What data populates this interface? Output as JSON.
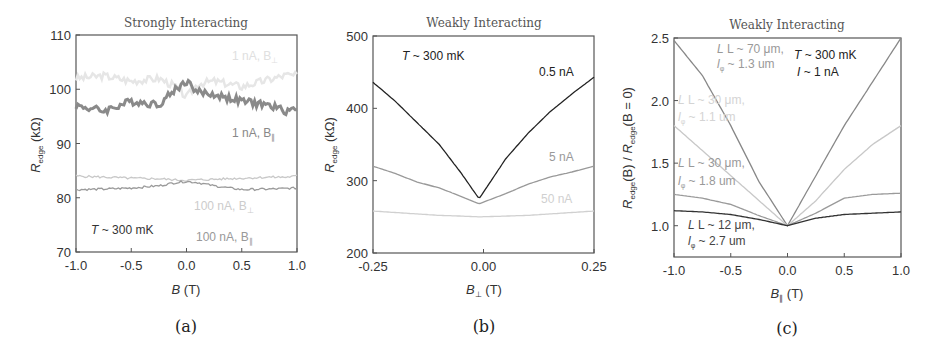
{
  "chart_data": [
    {
      "panel": "(a)",
      "type": "line",
      "title": "Strongly Interacting",
      "xlabel": "B (T)",
      "ylabel": "R_edge (kΩ)",
      "xlim": [
        -1.0,
        1.0
      ],
      "ylim": [
        70,
        110
      ],
      "xticks": [
        "-1.0",
        "-0.5",
        "0.0",
        "0.5",
        "1.0"
      ],
      "yticks": [
        "70",
        "80",
        "90",
        "100",
        "110"
      ],
      "annotation": "T ~ 300 mK",
      "x": [
        -1.0,
        -0.75,
        -0.5,
        -0.25,
        -0.1,
        0.0,
        0.1,
        0.25,
        0.5,
        0.75,
        0.9,
        1.0
      ],
      "series": [
        {
          "name": "1 nA, B⊥",
          "color": "#e6e6e6",
          "values": [
            102,
            102.5,
            101.5,
            102,
            100.5,
            98.5,
            101,
            101.5,
            100.5,
            101.8,
            102.6,
            102.5
          ]
        },
        {
          "name": "1 nA, B∥",
          "color": "#8a8a8a",
          "values": [
            97,
            96,
            97.8,
            97.2,
            100,
            101.5,
            99.5,
            99,
            97.8,
            97,
            96,
            96.5
          ]
        },
        {
          "name": "100 nA, B⊥",
          "color": "#c8c8c8",
          "values": [
            84,
            83.8,
            83.6,
            83.5,
            83.3,
            83.2,
            83.3,
            83.4,
            83.6,
            83.8,
            83.8,
            84
          ]
        },
        {
          "name": "100 nA, B∥",
          "color": "#9a9a9a",
          "values": [
            81.5,
            81.6,
            81.8,
            82.2,
            82.8,
            83.0,
            82.8,
            82.2,
            81.5,
            81.6,
            81.7,
            81.8
          ]
        }
      ],
      "labels": {
        "s0": "1 nA, B",
        "s0_sub": "⊥",
        "s1": "1 nA, B",
        "s1_sub": "∥",
        "s2": "100 nA, B",
        "s2_sub": "⊥",
        "s3": "100 nA, B",
        "s3_sub": "∥"
      },
      "caption": "(a)"
    },
    {
      "panel": "(b)",
      "type": "line",
      "title": "Weakly Interacting",
      "xlabel": "B⊥ (T)",
      "ylabel": "R_edge (kΩ)",
      "xlim": [
        -0.25,
        0.25
      ],
      "ylim": [
        200,
        500
      ],
      "xticks": [
        "-0.25",
        "0.00",
        "0.25"
      ],
      "yticks": [
        "200",
        "300",
        "400",
        "500"
      ],
      "annotation": "T ~ 300 mK",
      "x": [
        -0.25,
        -0.2,
        -0.15,
        -0.1,
        -0.05,
        -0.01,
        0.05,
        0.1,
        0.15,
        0.2,
        0.25
      ],
      "series": [
        {
          "name": "0.5 nA",
          "color": "#222222",
          "values": [
            436,
            410,
            380,
            350,
            310,
            275,
            330,
            365,
            395,
            420,
            443
          ]
        },
        {
          "name": "5 nA",
          "color": "#999999",
          "values": [
            320,
            310,
            298,
            290,
            278,
            268,
            282,
            295,
            305,
            312,
            320
          ]
        },
        {
          "name": "50 nA",
          "color": "#d0d0d0",
          "values": [
            258,
            256,
            254,
            252,
            251,
            250,
            251,
            252,
            254,
            256,
            258
          ]
        }
      ],
      "caption": "(b)"
    },
    {
      "panel": "(c)",
      "type": "line",
      "title": "Weakly Interacting",
      "xlabel": "B∥ (T)",
      "ylabel": "R_edge(B) / R_edge(B = 0)",
      "xlim": [
        -1.0,
        1.0
      ],
      "ylim": [
        0.75,
        2.5
      ],
      "xticks": [
        "-1.0",
        "-0.5",
        "0.0",
        "0.5",
        "1.0"
      ],
      "yticks": [
        "1.0",
        "1.5",
        "2.0",
        "2.5"
      ],
      "annotation": [
        "T ~ 300 mK",
        "I ~ 1 nA"
      ],
      "x": [
        -1.0,
        -0.75,
        -0.5,
        -0.25,
        0.0,
        0.25,
        0.5,
        0.75,
        1.0
      ],
      "series": [
        {
          "name": "L ~ 70 μm, lφ ~ 1.3 um",
          "color": "#888888",
          "values": [
            2.48,
            2.2,
            1.8,
            1.35,
            1.0,
            1.4,
            1.8,
            2.15,
            2.5
          ]
        },
        {
          "name": "L ~ 30 μm, lφ ~ 1.1 um",
          "color": "#c8c8c8",
          "values": [
            1.8,
            1.6,
            1.4,
            1.2,
            1.0,
            1.2,
            1.45,
            1.65,
            1.8
          ]
        },
        {
          "name": "L ~ 30 μm, lφ ~ 1.8 um",
          "color": "#9a9a9a",
          "values": [
            1.25,
            1.22,
            1.17,
            1.08,
            1.0,
            1.1,
            1.22,
            1.25,
            1.26
          ]
        },
        {
          "name": "L ~ 12 μm, lφ ~ 2.7 um",
          "color": "#333333",
          "values": [
            1.12,
            1.11,
            1.09,
            1.05,
            1.0,
            1.06,
            1.09,
            1.1,
            1.11
          ]
        }
      ],
      "labels": {
        "s0a": "L ~ 70 μm,",
        "s0b": "l",
        "s0c": "~ 1.3 um",
        "s1a": "L ~ 30 μm,",
        "s1b": "l",
        "s1c": "~ 1.1 um",
        "s2a": "L ~ 30 μm,",
        "s2b": "l",
        "s2c": "~ 1.8 um",
        "s3a": "L ~ 12 μm,",
        "s3b": "l",
        "s3c": "~ 2.7 um",
        "phi": "φ"
      },
      "caption": "(c)"
    }
  ],
  "common": {
    "sub_edge": "edge",
    "unit_T": "(T)",
    "unit_kohm": "(kΩ)",
    "R": "R",
    "B": "B",
    "ratio_mid": "(B) / ",
    "ratio_end": "(B = 0)",
    "temp": "T",
    "temp_val": "~ 300 mK",
    "cur": "I",
    "cur_val": "~ 1 nA"
  }
}
